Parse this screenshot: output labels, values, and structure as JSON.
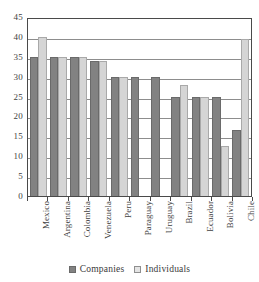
{
  "chart_data": {
    "type": "bar",
    "title": "",
    "xlabel": "",
    "ylabel": "",
    "ylim": [
      0,
      45
    ],
    "ytick_step": 5,
    "yticks": [
      45,
      40,
      35,
      30,
      25,
      20,
      15,
      10,
      5,
      0
    ],
    "grid": true,
    "legend_position": "bottom",
    "categories": [
      "Mexico",
      "Argentina",
      "Colombia",
      "Venezuela",
      "Peru",
      "Paraguay",
      "Uruguay",
      "Brazil",
      "Ecuador",
      "Bolivia",
      "Chile"
    ],
    "series": [
      {
        "name": "Companies",
        "color": "#828282",
        "values": [
          35,
          35,
          35,
          34,
          30,
          30,
          30,
          25,
          25,
          25,
          16.5
        ]
      },
      {
        "name": "Individuals",
        "color": "#d5d5d5",
        "values": [
          40,
          35,
          35,
          34,
          30,
          null,
          null,
          28,
          25,
          12.5,
          39.5
        ]
      }
    ]
  },
  "legend": {
    "items": [
      {
        "label": "Companies",
        "swatch": "companies-swatch"
      },
      {
        "label": "Individuals",
        "swatch": "individuals-swatch"
      }
    ]
  }
}
